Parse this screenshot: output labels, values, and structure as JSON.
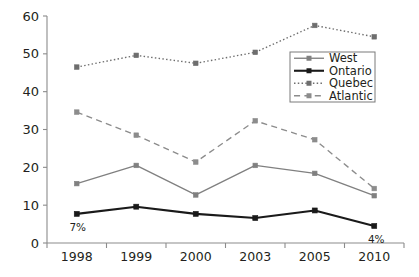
{
  "chart_data": {
    "type": "line",
    "title": "",
    "xlabel": "",
    "ylabel": "",
    "categories": [
      "1998",
      "1999",
      "2000",
      "2003",
      "2005",
      "2010"
    ],
    "ylim": [
      0,
      60
    ],
    "yticks": [
      0,
      10,
      20,
      30,
      40,
      50,
      60
    ],
    "grid": false,
    "legend_position": "center-right",
    "series": [
      {
        "name": "West",
        "values": [
          15.7,
          20.5,
          12.7,
          20.5,
          18.4,
          12.5
        ],
        "color": "#808080",
        "style": "solid",
        "marker": "square"
      },
      {
        "name": "Ontario",
        "values": [
          7.7,
          9.6,
          7.7,
          6.6,
          8.6,
          4.5
        ],
        "color": "#1a1a1a",
        "style": "solid",
        "marker": "square"
      },
      {
        "name": "Quebec",
        "values": [
          46.5,
          49.6,
          47.5,
          50.4,
          57.5,
          54.5
        ],
        "color": "#6e6e6e",
        "style": "dotted",
        "marker": "square"
      },
      {
        "name": "Atlantic",
        "values": [
          34.6,
          28.5,
          21.4,
          32.3,
          27.3,
          14.4
        ],
        "color": "#8c8c8c",
        "style": "dashed",
        "marker": "square"
      }
    ],
    "annotations": [
      {
        "text": "7%",
        "category": "1998",
        "series": "Ontario"
      },
      {
        "text": "4%",
        "category": "2010",
        "series": "Ontario"
      }
    ]
  },
  "legend": {
    "entries": [
      "West",
      "Ontario",
      "Quebec",
      "Atlantic"
    ]
  },
  "axis": {
    "y_tick_labels": [
      "60",
      "50",
      "40",
      "30",
      "20",
      "10",
      "0"
    ],
    "x_tick_labels": [
      "1998",
      "1999",
      "2000",
      "2003",
      "2005",
      "2010"
    ]
  }
}
